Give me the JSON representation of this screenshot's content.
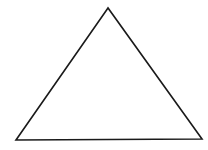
{
  "diagram": {
    "shape": "triangle",
    "background": "#ffffff",
    "stroke_color": "#1a1a1a",
    "fill_color": "#ffffff",
    "stroke_width": 1.6,
    "vertices": [
      {
        "name": "apex",
        "x": 108,
        "y": 8
      },
      {
        "name": "bottom-left",
        "x": 16,
        "y": 140
      },
      {
        "name": "bottom-right",
        "x": 202,
        "y": 139
      }
    ]
  }
}
